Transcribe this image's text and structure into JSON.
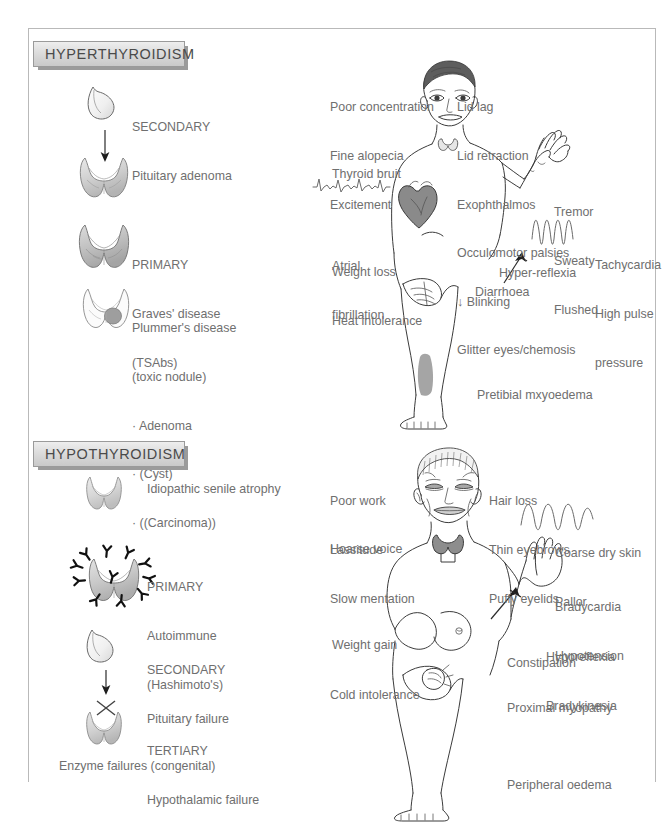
{
  "page": {
    "border_color": "#b9b9b9",
    "background": "#ffffff",
    "text_color": "#6f6f6f"
  },
  "sections": [
    {
      "id": "hyperthyroidism",
      "banner_label": "HYPERTHYROIDISM",
      "causes": [
        {
          "icon": "pituitary-gland-icon",
          "lines": [
            "SECONDARY",
            "Pituitary adenoma"
          ]
        },
        {
          "icon": "thyroid-gland-icon",
          "lines": [
            "PRIMARY",
            "Graves' disease",
            "(TSAbs)"
          ]
        },
        {
          "icon": "thyroid-nodule-icon",
          "lines": [
            "Plummer's disease",
            "(toxic nodule)",
            "· Adenoma",
            "· (Cyst)",
            "· ((Carcinoma))"
          ]
        }
      ],
      "figure": {
        "name": "hyperthyroid-patient-figure",
        "labels_left": [
          {
            "name": "poor-concentration",
            "lines": [
              "Poor concentration",
              "Fine alopecia",
              "Excitement"
            ]
          },
          {
            "name": "thyroid-bruit",
            "lines": [
              "Thyroid bruit"
            ]
          },
          {
            "name": "atrial-fibrillation",
            "lines": [
              "Atrial",
              "fibrillation"
            ]
          },
          {
            "name": "weight-loss",
            "lines": [
              "Weight loss"
            ]
          },
          {
            "name": "heat-intolerance",
            "lines": [
              "Heat intolerance"
            ]
          }
        ],
        "labels_right": [
          {
            "name": "eye-signs",
            "lines": [
              "Lid lag",
              "Lid retraction",
              "Exophthalmos",
              "Occulomotor palsies",
              "↓ Blinking",
              "Glitter eyes/chemosis"
            ]
          },
          {
            "name": "hand-signs",
            "lines": [
              "Tremor",
              "Sweaty",
              "Flushed"
            ]
          },
          {
            "name": "pulse-signs",
            "lines": [
              "Tachycardia",
              "High pulse",
              "pressure"
            ]
          },
          {
            "name": "hyper-reflexia",
            "lines": [
              "Hyper-reflexia"
            ]
          },
          {
            "name": "diarrhoea",
            "lines": [
              "Diarrhoea"
            ]
          },
          {
            "name": "pretibial-myxoedema",
            "lines": [
              "Pretibial mxyoedema"
            ]
          }
        ]
      }
    },
    {
      "id": "hypothyroidism",
      "banner_label": "HYPOTHYROIDISM",
      "causes": [
        {
          "icon": "atrophic-thyroid-icon",
          "lines": [
            "Idiopathic senile atrophy"
          ]
        },
        {
          "icon": "autoimmune-thyroid-icon",
          "lines": [
            "PRIMARY",
            "Autoimmune",
            "(Hashimoto's)"
          ]
        },
        {
          "icon": "pituitary-gland-icon",
          "lines": [
            "SECONDARY",
            "Pituitary failure"
          ]
        },
        {
          "icon": "thyroid-blocked-icon",
          "lines": [
            "TERTIARY",
            "Hypothalamic failure"
          ]
        }
      ],
      "footnote": "Enzyme failures (congenital)",
      "figure": {
        "name": "hypothyroid-patient-figure",
        "labels_left": [
          {
            "name": "poor-work",
            "lines": [
              "Poor work",
              "Lassitude",
              "Slow mentation"
            ]
          },
          {
            "name": "hoarse-voice",
            "lines": [
              "Hoarse voice"
            ]
          },
          {
            "name": "weight-gain",
            "lines": [
              "Weight gain"
            ]
          },
          {
            "name": "cold-intolerance",
            "lines": [
              "Cold intolerance"
            ]
          }
        ],
        "labels_right": [
          {
            "name": "head-signs",
            "lines": [
              "Hair loss",
              "Thin eyebrows",
              "Puffy eyelids"
            ]
          },
          {
            "name": "skin-signs",
            "lines": [
              "Coarse dry skin",
              "Pallor"
            ]
          },
          {
            "name": "pulse-signs",
            "lines": [
              "Bradycardia",
              "Hypotension"
            ]
          },
          {
            "name": "reflex-signs",
            "lines": [
              "Hyporeflexia",
              "Bradykinesia"
            ]
          },
          {
            "name": "constipation",
            "lines": [
              "Constipation"
            ]
          },
          {
            "name": "proximal-myopathy",
            "lines": [
              "Proximal myopathy"
            ]
          },
          {
            "name": "peripheral-oedema",
            "lines": [
              "Peripheral oedema"
            ]
          }
        ]
      }
    }
  ],
  "text": {
    "hyper_banner": "HYPERTHYROIDISM",
    "hypo_banner": "HYPOTHYROIDISM",
    "h_secondary_1": "SECONDARY",
    "h_secondary_2": "Pituitary adenoma",
    "h_primary_1": "PRIMARY",
    "h_primary_2": "Graves' disease",
    "h_primary_3": "(TSAbs)",
    "h_plummer_1": "Plummer's disease",
    "h_plummer_2": "(toxic nodule)",
    "h_plummer_3": "· Adenoma",
    "h_plummer_4": "· (Cyst)",
    "h_plummer_5": "· ((Carcinoma))",
    "h_fig_l1a": "Poor concentration",
    "h_fig_l1b": "Fine alopecia",
    "h_fig_l1c": "Excitement",
    "h_fig_l2": "Thyroid bruit",
    "h_fig_l3a": "Atrial",
    "h_fig_l3b": "fibrillation",
    "h_fig_l4": "Weight loss",
    "h_fig_l5": "Heat intolerance",
    "h_fig_r1a": "Lid lag",
    "h_fig_r1b": "Lid retraction",
    "h_fig_r1c": "Exophthalmos",
    "h_fig_r1d": "Occulomotor palsies",
    "h_fig_r1e": "↓ Blinking",
    "h_fig_r1f": "Glitter eyes/chemosis",
    "h_fig_r2a": "Tremor",
    "h_fig_r2b": "Sweaty",
    "h_fig_r2c": "Flushed",
    "h_fig_r3a": "Tachycardia",
    "h_fig_r3b": "High pulse",
    "h_fig_r3c": "pressure",
    "h_fig_r4": "Hyper-reflexia",
    "h_fig_r5": "Diarrhoea",
    "h_fig_r6": "Pretibial mxyoedema",
    "o_idiopathic": "Idiopathic senile atrophy",
    "o_primary_1": "PRIMARY",
    "o_primary_2": "Autoimmune",
    "o_primary_3": "(Hashimoto's)",
    "o_secondary_1": "SECONDARY",
    "o_secondary_2": "Pituitary failure",
    "o_tertiary_1": "TERTIARY",
    "o_tertiary_2": "Hypothalamic failure",
    "o_enzyme": "Enzyme failures (congenital)",
    "o_fig_l1a": "Poor work",
    "o_fig_l1b": "Lassitude",
    "o_fig_l1c": "Slow mentation",
    "o_fig_l2": "Hoarse voice",
    "o_fig_l3": "Weight gain",
    "o_fig_l4": "Cold intolerance",
    "o_fig_r1a": "Hair loss",
    "o_fig_r1b": "Thin eyebrows",
    "o_fig_r1c": "Puffy eyelids",
    "o_fig_r2a": "Coarse dry skin",
    "o_fig_r2b": "Pallor",
    "o_fig_r3a": "Bradycardia",
    "o_fig_r3b": "Hypotension",
    "o_fig_r4a": "Hyporeflexia",
    "o_fig_r4b": "Bradykinesia",
    "o_fig_r5": "Constipation",
    "o_fig_r6": "Proximal myopathy",
    "o_fig_r7": "Peripheral oedema"
  }
}
